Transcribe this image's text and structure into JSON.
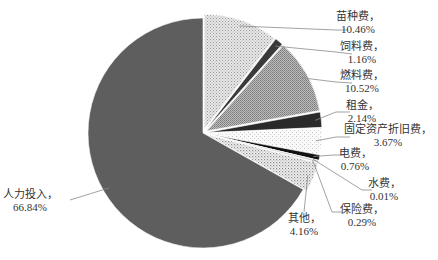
{
  "chart_data": {
    "type": "pie",
    "title": "",
    "start_angle": "12 o'clock",
    "direction": "clockwise",
    "exploded": [
      "苗种费",
      "饲料费",
      "燃料费",
      "租金",
      "固定资产折旧费",
      "电费",
      "水费",
      "保险费",
      "其他"
    ],
    "slices": [
      {
        "name": "苗种费",
        "value": 10.46,
        "label": "苗种费，",
        "pct_label": "10.46%",
        "fill": "pattern-light-dots"
      },
      {
        "name": "饲料费",
        "value": 1.16,
        "label": "饲料费，",
        "pct_label": "1.16%",
        "fill": "#3a3a3a"
      },
      {
        "name": "燃料费",
        "value": 10.52,
        "label": "燃料费，",
        "pct_label": "10.52%",
        "fill": "pattern-medium-gray"
      },
      {
        "name": "租金",
        "value": 2.14,
        "label": "租金，",
        "pct_label": "2.14%",
        "fill": "#2a2a2a"
      },
      {
        "name": "固定资产折旧费",
        "value": 3.67,
        "label": "固定资产折旧费，",
        "pct_label": "3.67%",
        "fill": "pattern-sparse-dots"
      },
      {
        "name": "电费",
        "value": 0.76,
        "label": "电费，",
        "pct_label": "0.76%",
        "fill": "#111111"
      },
      {
        "name": "水费",
        "value": 0.01,
        "label": "水费，",
        "pct_label": "0.01%",
        "fill": "#555555"
      },
      {
        "name": "保险费",
        "value": 0.29,
        "label": "保险费，",
        "pct_label": "0.29%",
        "fill": "#cccccc"
      },
      {
        "name": "其他",
        "value": 4.16,
        "label": "其他，",
        "pct_label": "4.16%",
        "fill": "pattern-dense-dots"
      },
      {
        "name": "人力投入",
        "value": 66.84,
        "label": "人力投入，",
        "pct_label": "66.84%",
        "fill": "#5e5e5e"
      }
    ],
    "legend": "none",
    "labels": "outside with leader lines"
  }
}
